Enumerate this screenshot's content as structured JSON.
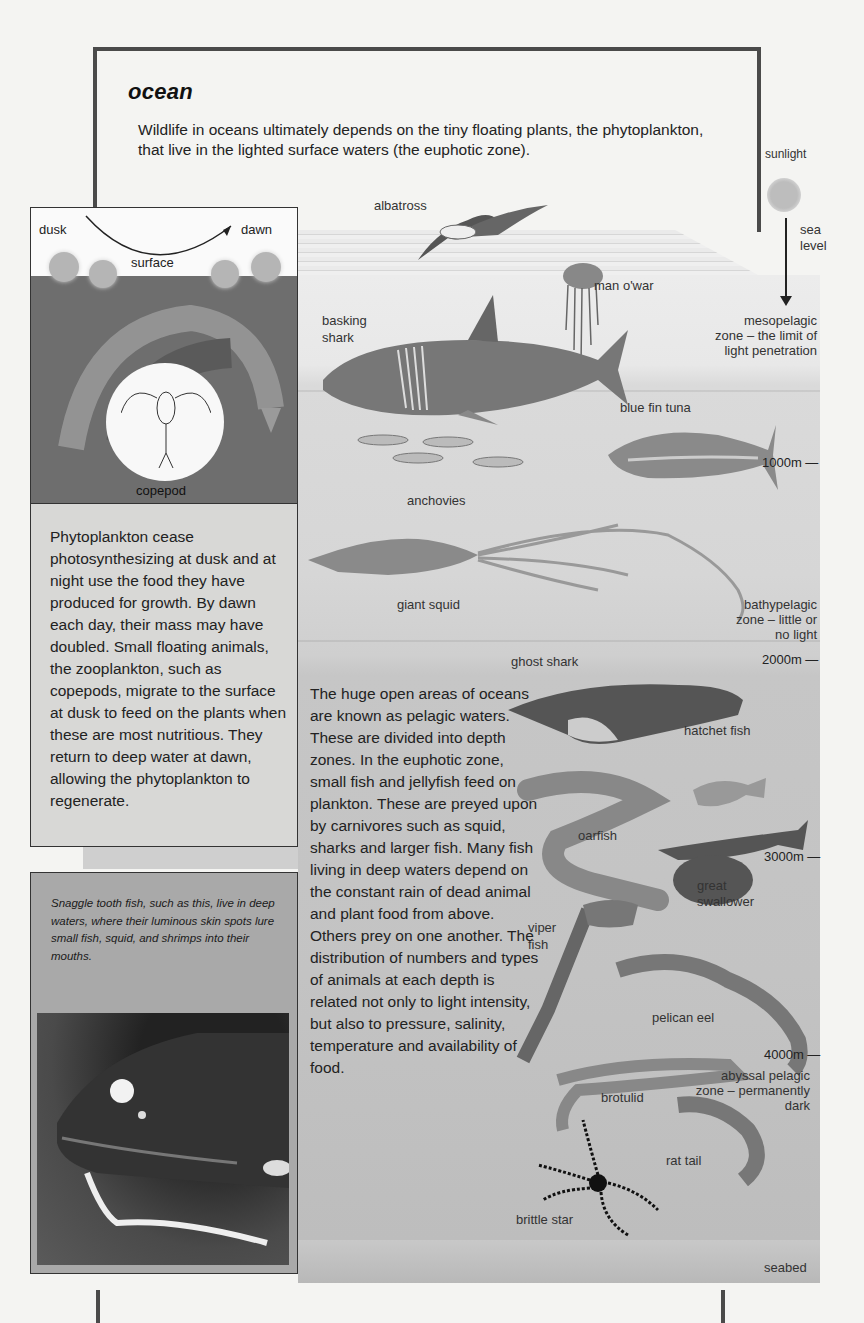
{
  "page": {
    "title": "ocean",
    "intro": "Wildlife in oceans ultimately depends on the tiny floating plants, the phytoplankton, that live in the lighted surface waters  (the euphotic zone)."
  },
  "migration_diagram": {
    "dusk_label": "dusk",
    "dawn_label": "dawn",
    "surface_label": "surface",
    "organism_label": "copepod"
  },
  "phytoplankton_box": {
    "text": "Phytoplankton cease photosynthesizing at dusk and at night use the food they have produced for growth. By dawn each day, their mass may have doubled. Small floating animals, the zooplankton, such as copepods, migrate to the surface at dusk to feed on the plants when these are most nutritious. They return to deep water at dawn, allowing the phytoplankton to regenerate."
  },
  "photo_box": {
    "caption": "Snaggle tooth fish, such as this, live in deep waters, where their luminous skin spots lure small fish, squid, and shrimps into their mouths."
  },
  "body_text": "The huge open areas of oceans are known as pelagic waters. These are divided into depth zones. In the euphotic zone, small fish and jellyfish feed on plankton. These are preyed upon by carnivores such as squid, sharks and larger fish. Many fish living in deep waters depend on the constant rain of dead animal and plant food from above. Others prey on one another. The distribution of numbers and types of animals at each depth is related not only to light intensity, but also to pressure, salinity, temperature and availability of food.",
  "scene": {
    "sunlight_label": "sunlight",
    "sea_level_label": [
      "sea",
      "level"
    ],
    "seabed_label": "seabed",
    "zones": [
      {
        "lines": [
          "mesopelagic",
          "zone – the limit of",
          "light penetration"
        ]
      },
      {
        "lines": [
          "bathypelagic",
          "zone – little or",
          "no light"
        ]
      },
      {
        "lines": [
          "abyssal pelagic",
          "zone – permanently",
          "dark"
        ]
      }
    ],
    "depths": [
      "1000m —",
      "2000m —",
      "3000m —",
      "4000m —"
    ],
    "animals": [
      "albatross",
      "man o'war",
      "basking shark",
      "blue fin tuna",
      "anchovies",
      "giant squid",
      "ghost shark",
      "hatchet fish",
      "oarfish",
      "great swallower",
      "viper fish",
      "pelican eel",
      "brotulid",
      "rat tail",
      "brittle star"
    ],
    "animal_labels": {
      "albatross": "albatross",
      "man_o_war": "man o'war",
      "basking_shark_1": "basking",
      "basking_shark_2": "shark",
      "blue_fin_tuna": "blue fin tuna",
      "anchovies": "anchovies",
      "giant_squid": "giant squid",
      "ghost_shark": "ghost shark",
      "hatchet_fish": "hatchet fish",
      "oarfish": "oarfish",
      "great_swallower_1": "great",
      "great_swallower_2": "swallower",
      "viper_fish_1": "viper",
      "viper_fish_2": "fish",
      "pelican_eel": "pelican eel",
      "brotulid": "brotulid",
      "rat_tail": "rat tail",
      "brittle_star": "brittle star"
    }
  }
}
